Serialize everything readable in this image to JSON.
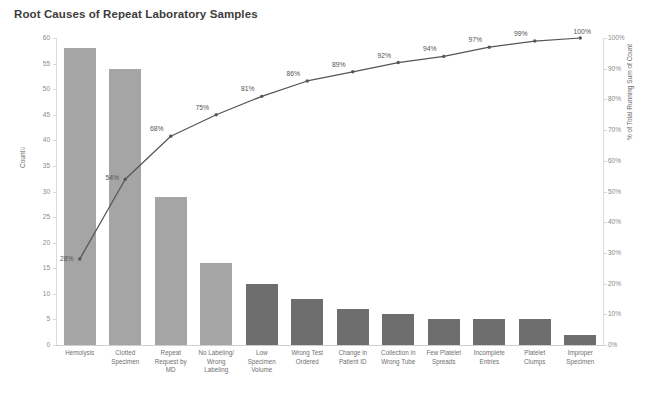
{
  "chart_data": {
    "type": "bar",
    "title": "Root Causes of Repeat Laboratory Samples",
    "xlabel": "",
    "ylabel": "Count",
    "y2label": "% of Total Running Sum of Count",
    "ylim": [
      0,
      60
    ],
    "y2lim": [
      0,
      100
    ],
    "grid": false,
    "legend": "none",
    "categories": [
      "Hemolysis",
      "Clotted Specimen",
      "Repeat Request by MD",
      "No Labeling/ Wrong Labeling",
      "Low Specimen Volume",
      "Wrong Test Ordered",
      "Change in Patient ID",
      "Collection in Wrong Tube",
      "Few Platelet Spreads",
      "Incomplete Entries",
      "Platelet Clumps",
      "Improper Specimen"
    ],
    "category_lines": [
      [
        "Hemolysis"
      ],
      [
        "Clotted",
        "Specimen"
      ],
      [
        "Repeat",
        "Request by",
        "MD"
      ],
      [
        "No Labeling/",
        "Wrong",
        "Labeling"
      ],
      [
        "Low",
        "Specimen",
        "Volume"
      ],
      [
        "Wrong Test",
        "Ordered"
      ],
      [
        "Change in",
        "Patient ID"
      ],
      [
        "Collection in",
        "Wrong Tube"
      ],
      [
        "Few Platelet",
        "Spreads"
      ],
      [
        "Incomplete",
        "Entries"
      ],
      [
        "Platelet",
        "Clumps"
      ],
      [
        "Improper",
        "Specimen"
      ]
    ],
    "series": [
      {
        "name": "Count",
        "type": "bar",
        "axis": "left",
        "values": [
          58,
          54,
          29,
          16,
          12,
          9,
          7,
          6,
          5,
          5,
          5,
          2
        ],
        "colors": [
          "#a5a5a5",
          "#a5a5a5",
          "#a5a5a5",
          "#a5a5a5",
          "#6e6e6e",
          "#6e6e6e",
          "#6e6e6e",
          "#6e6e6e",
          "#6e6e6e",
          "#6e6e6e",
          "#6e6e6e",
          "#6e6e6e"
        ]
      },
      {
        "name": "% of Total Running Sum of Count",
        "type": "line",
        "axis": "right",
        "values": [
          28,
          54,
          68,
          75,
          81,
          86,
          89,
          92,
          94,
          97,
          99,
          100
        ],
        "labels": [
          "28%",
          "54%",
          "68%",
          "75%",
          "81%",
          "86%",
          "89%",
          "92%",
          "94%",
          "97%",
          "99%",
          "100%"
        ],
        "color": "#555555"
      }
    ],
    "y_ticks": [
      "0",
      "5",
      "10",
      "15",
      "20",
      "25",
      "30",
      "35",
      "40",
      "45",
      "50",
      "55",
      "60"
    ],
    "y2_ticks": [
      "0%",
      "10%",
      "20%",
      "30%",
      "40%",
      "50%",
      "60%",
      "70%",
      "80%",
      "90%",
      "100%"
    ]
  },
  "axes": {
    "left_title": "Count",
    "left_sort_indicator": "⇩",
    "right_title": "% of Total Running Sum of Count"
  },
  "colors": {
    "background": "#ffffff",
    "bar_light": "#a5a5a5",
    "bar_dark": "#6e6e6e",
    "line": "#555555",
    "axis": "#dcdcdc",
    "title_text": "#3d3d3d",
    "tick_text": "#8a8a8a"
  }
}
